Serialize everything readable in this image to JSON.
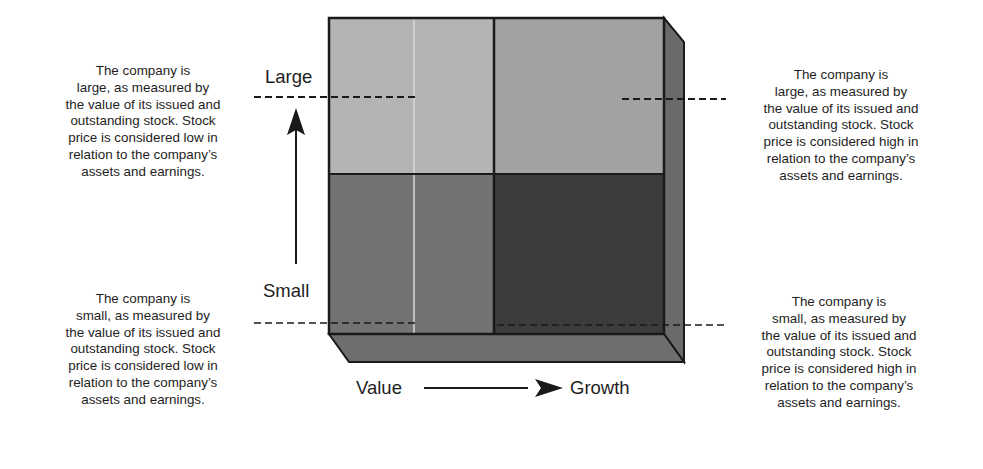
{
  "axes": {
    "vertical": {
      "top_label": "Large",
      "bottom_label": "Small"
    },
    "horizontal": {
      "left_label": "Value",
      "right_label": "Growth"
    }
  },
  "quadrants": [
    {
      "id": "large-value",
      "color": "#b4b4b4"
    },
    {
      "id": "large-growth",
      "color": "#a2a2a2"
    },
    {
      "id": "small-value",
      "color": "#737373"
    },
    {
      "id": "small-growth",
      "color": "#3c3c3c"
    }
  ],
  "box_colors": {
    "side": "#6a6a6a",
    "bottom": "#6e6e6e",
    "outline": "#1a1a1a"
  },
  "descriptions": {
    "large_value": "The company is\nlarge, as measured by\nthe value of its issued and\noutstanding stock.  Stock\nprice is considered low in\nrelation to the company’s\nassets and earnings.",
    "large_growth": "The company is\nlarge, as measured by\nthe value of its issued and\noutstanding stock.  Stock\nprice is considered high in\nrelation to the company’s\nassets and earnings.",
    "small_value": "The company is\nsmall, as measured by\nthe value of its issued and\noutstanding stock.  Stock\nprice is considered low in\nrelation to the company’s\nassets and earnings.",
    "small_growth": "The company is\nsmall, as measured by\nthe value of its issued and\noutstanding stock.  Stock\nprice is considered high in\nrelation to the company’s\nassets and earnings."
  }
}
